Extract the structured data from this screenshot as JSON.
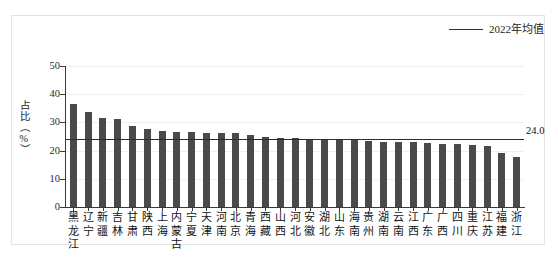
{
  "chart_data": {
    "type": "bar",
    "title": "",
    "xlabel": "",
    "ylabel": "占比（%）",
    "ylim": [
      0,
      50
    ],
    "yticks": [
      0,
      10,
      20,
      30,
      40,
      50
    ],
    "grid": true,
    "legend_position": "top-right",
    "legend": [
      {
        "name": "2022年均值",
        "type": "line",
        "color": "#2b2b2b"
      }
    ],
    "bar_color": "#4a4a4a",
    "categories": [
      "黑龙江",
      "辽宁",
      "新疆",
      "吉林",
      "甘肃",
      "陕西",
      "上海",
      "内蒙古",
      "宁夏",
      "天津",
      "河南",
      "北京",
      "青海",
      "西藏",
      "山西",
      "河北",
      "安徽",
      "湖北",
      "山东",
      "海南",
      "贵州",
      "湖南",
      "云南",
      "江西",
      "广东",
      "广西",
      "四川",
      "重庆",
      "江苏",
      "福建",
      "浙江"
    ],
    "values": [
      36.5,
      33.8,
      31.4,
      31.3,
      28.8,
      27.6,
      26.8,
      26.6,
      26.5,
      26.4,
      26.3,
      26.2,
      25.6,
      25.0,
      24.6,
      24.3,
      24.2,
      24.1,
      24.0,
      23.6,
      23.4,
      23.2,
      23.1,
      22.9,
      22.8,
      22.4,
      22.3,
      22.1,
      21.6,
      19.2,
      17.8
    ],
    "reference_line": {
      "label": "2022年均值",
      "value": 24.0,
      "value_label": "24.0",
      "color": "#2b2b2b"
    }
  }
}
